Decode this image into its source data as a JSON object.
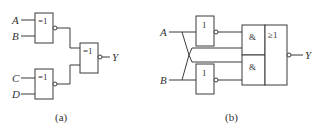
{
  "diagram_a": {
    "caption": "(a)",
    "inputs": [
      "A",
      "B",
      "C",
      "D"
    ],
    "output": "Y",
    "gates": [
      {
        "id": "g1",
        "symbol": "=1",
        "type": "XNOR",
        "inputs": [
          "A",
          "B"
        ]
      },
      {
        "id": "g2",
        "symbol": "=1",
        "type": "XNOR",
        "inputs": [
          "C",
          "D"
        ]
      },
      {
        "id": "g3",
        "symbol": "=1",
        "type": "XNOR",
        "inputs": [
          "g1",
          "g2"
        ],
        "output": "Y"
      }
    ]
  },
  "diagram_b": {
    "caption": "(b)",
    "inputs": [
      "A",
      "B"
    ],
    "output": "Y",
    "gates": [
      {
        "id": "n1",
        "symbol": "1",
        "type": "NOT",
        "inputs": [
          "A"
        ]
      },
      {
        "id": "n2",
        "symbol": "1",
        "type": "NOT",
        "inputs": [
          "B"
        ]
      },
      {
        "id": "and1",
        "symbol": "&",
        "type": "AND",
        "inputs": [
          "n1",
          "B"
        ]
      },
      {
        "id": "and2",
        "symbol": "&",
        "type": "AND",
        "inputs": [
          "A",
          "n2"
        ]
      },
      {
        "id": "nor",
        "symbol": "≥1",
        "type": "NOR",
        "inputs": [
          "and1",
          "and2"
        ],
        "output": "Y"
      }
    ]
  }
}
